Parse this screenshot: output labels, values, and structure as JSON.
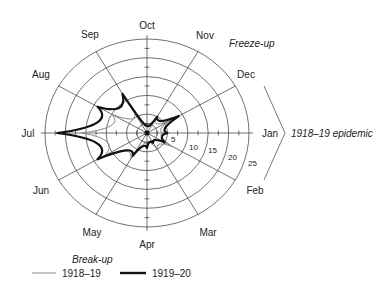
{
  "chart_data": {
    "type": "radar",
    "title": "",
    "center_labels": {
      "top_right": "Freeze-up",
      "bottom_left": "Break-up",
      "bracket_label": "1918–19 epidemic",
      "bracket_spans": [
        "Dec",
        "Jan",
        "Feb"
      ]
    },
    "categories": [
      "Jan",
      "Feb",
      "Mar",
      "Apr",
      "May",
      "Jun",
      "Jul",
      "Aug",
      "Sep",
      "Oct",
      "Nov",
      "Dec"
    ],
    "radial_ticks": [
      5,
      10,
      15,
      20,
      25
    ],
    "rlim": [
      0,
      25
    ],
    "grid": true,
    "series": [
      {
        "name": "1918–19",
        "color": "#888888",
        "line_width": 1,
        "values": [
          4,
          7,
          5,
          3,
          8,
          12,
          16,
          10,
          6,
          2,
          4,
          6
        ]
      },
      {
        "name": "1919–20",
        "color": "#111111",
        "line_width": 2.2,
        "values": [
          5,
          5,
          3,
          4,
          7,
          14,
          22,
          14,
          12,
          2,
          5,
          9
        ]
      }
    ],
    "legend": {
      "position": "bottom-left",
      "entries": [
        "1918–19",
        "1919–20"
      ]
    }
  },
  "labels": {
    "months": {
      "Jan": "Jan",
      "Feb": "Feb",
      "Mar": "Mar",
      "Apr": "Apr",
      "May": "May",
      "Jun": "Jun",
      "Jul": "Jul",
      "Aug": "Aug",
      "Sep": "Sep",
      "Oct": "Oct",
      "Nov": "Nov",
      "Dec": "Dec"
    },
    "rings": [
      "5",
      "10",
      "15",
      "20",
      "25"
    ],
    "freeze_up": "Freeze-up",
    "break_up": "Break-up",
    "epidemic": "1918–19 epidemic",
    "legend_1918": "1918–19",
    "legend_1919": "1919–20"
  }
}
